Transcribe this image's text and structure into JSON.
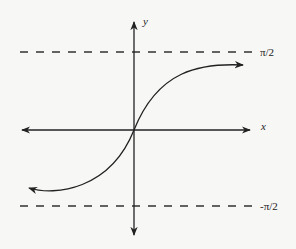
{
  "diagram": {
    "type": "function-graph",
    "function": "arctan-like (inverse tangent)",
    "axes": {
      "x_label": "x",
      "y_label": "y"
    },
    "asymptotes": [
      {
        "name": "upper",
        "label": "π/2"
      },
      {
        "name": "lower",
        "label": "-π/2"
      }
    ],
    "colors": {
      "ink": "#222222",
      "background": "#f7f7f5"
    }
  }
}
